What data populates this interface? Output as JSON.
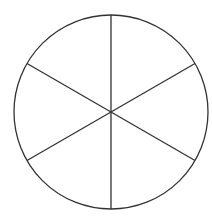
{
  "diagram": {
    "type": "divided-circle",
    "shape": "circle",
    "sectors": 6,
    "center": [
      111,
      112
    ],
    "radius": 97,
    "stroke_color": "#333333",
    "fill_color": "#ffffff",
    "background": "#ffffff"
  }
}
